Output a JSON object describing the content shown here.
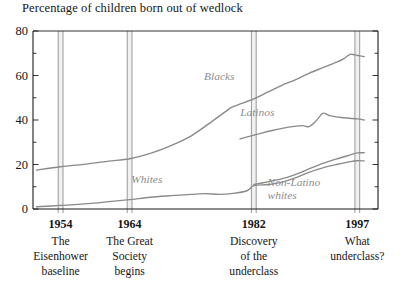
{
  "chart_title": "Percentage of children born out of wedlock",
  "chart_data": {
    "type": "line",
    "title": "Percentage of children born out of wedlock",
    "xlabel": "",
    "ylabel": "",
    "xlim": [
      1950,
      2000
    ],
    "ylim": [
      0,
      80
    ],
    "yticks": [
      0,
      20,
      40,
      60,
      80
    ],
    "yminorticks": [
      10,
      30,
      50,
      70
    ],
    "grid": false,
    "legend": "inline-labels",
    "series": [
      {
        "name": "Blacks",
        "color": "#8a8a8a",
        "label_x": 1977,
        "label_y": 58,
        "points": [
          [
            1950.5,
            17.5
          ],
          [
            1954,
            19.0
          ],
          [
            1958,
            20.3
          ],
          [
            1961,
            21.5
          ],
          [
            1964,
            22.6
          ],
          [
            1967,
            25.0
          ],
          [
            1970,
            28.5
          ],
          [
            1973,
            33.0
          ],
          [
            1976,
            39.5
          ],
          [
            1978,
            44.0
          ],
          [
            1979,
            46.0
          ],
          [
            1982,
            49.5
          ],
          [
            1984,
            52.5
          ],
          [
            1986,
            55.5
          ],
          [
            1988,
            58.0
          ],
          [
            1990,
            61.0
          ],
          [
            1992,
            63.5
          ],
          [
            1994,
            66.0
          ],
          [
            1995,
            67.5
          ],
          [
            1996,
            69.5
          ],
          [
            1997,
            69.0
          ],
          [
            1998,
            68.5
          ]
        ]
      },
      {
        "name": "Latinos",
        "color": "#8a8a8a",
        "label_x": 1982.5,
        "label_y": 42,
        "points": [
          [
            1980,
            31.5
          ],
          [
            1983,
            34.0
          ],
          [
            1985,
            35.5
          ],
          [
            1987,
            36.8
          ],
          [
            1989,
            37.5
          ],
          [
            1990,
            37.0
          ],
          [
            1991,
            39.5
          ],
          [
            1992,
            43.0
          ],
          [
            1993,
            42.0
          ],
          [
            1995,
            41.0
          ],
          [
            1997,
            40.5
          ],
          [
            1998,
            40.0
          ]
        ]
      },
      {
        "name": "Whites",
        "color": "#8a8a8a",
        "label_x": 1966.5,
        "label_y": 11.5,
        "points": [
          [
            1950.5,
            1.0
          ],
          [
            1954,
            1.6
          ],
          [
            1958,
            2.4
          ],
          [
            1961,
            3.3
          ],
          [
            1964,
            4.2
          ],
          [
            1967,
            5.3
          ],
          [
            1970,
            6.0
          ],
          [
            1973,
            6.6
          ],
          [
            1975,
            6.9
          ],
          [
            1977,
            6.6
          ],
          [
            1979,
            7.0
          ],
          [
            1981,
            8.2
          ],
          [
            1982,
            10.5
          ],
          [
            1984,
            11.0
          ],
          [
            1986,
            12.0
          ],
          [
            1988,
            14.0
          ],
          [
            1990,
            16.5
          ],
          [
            1992,
            18.5
          ],
          [
            1994,
            20.0
          ],
          [
            1996,
            21.3
          ],
          [
            1997,
            21.7
          ],
          [
            1998,
            21.6
          ]
        ]
      },
      {
        "name": "Non-Latino whites",
        "color": "#8a8a8a",
        "label_x": 1984,
        "label_y": 10.5,
        "points": [
          [
            1982,
            11.0
          ],
          [
            1984,
            12.2
          ],
          [
            1986,
            13.5
          ],
          [
            1988,
            15.5
          ],
          [
            1990,
            18.0
          ],
          [
            1992,
            20.5
          ],
          [
            1994,
            22.5
          ],
          [
            1996,
            24.3
          ],
          [
            1997,
            25.2
          ],
          [
            1998,
            25.3
          ]
        ]
      }
    ],
    "markers": [
      {
        "year": "1954",
        "x": 1954,
        "caption": [
          "The",
          "Eisenhower",
          "baseline"
        ]
      },
      {
        "year": "1964",
        "x": 1964,
        "caption": [
          "The Great",
          "Society",
          "begins"
        ]
      },
      {
        "year": "1982",
        "x": 1982,
        "caption": [
          "Discovery",
          "of the",
          "underclass"
        ]
      },
      {
        "year": "1997",
        "x": 1997,
        "caption": [
          "What",
          "underclass?"
        ]
      }
    ]
  },
  "colors": {
    "series": "#8a8a8a",
    "axis": "#1b1b1b",
    "marker_band": "#f0f0f0",
    "marker_line": "#8e8e8e",
    "text": "#161616"
  }
}
